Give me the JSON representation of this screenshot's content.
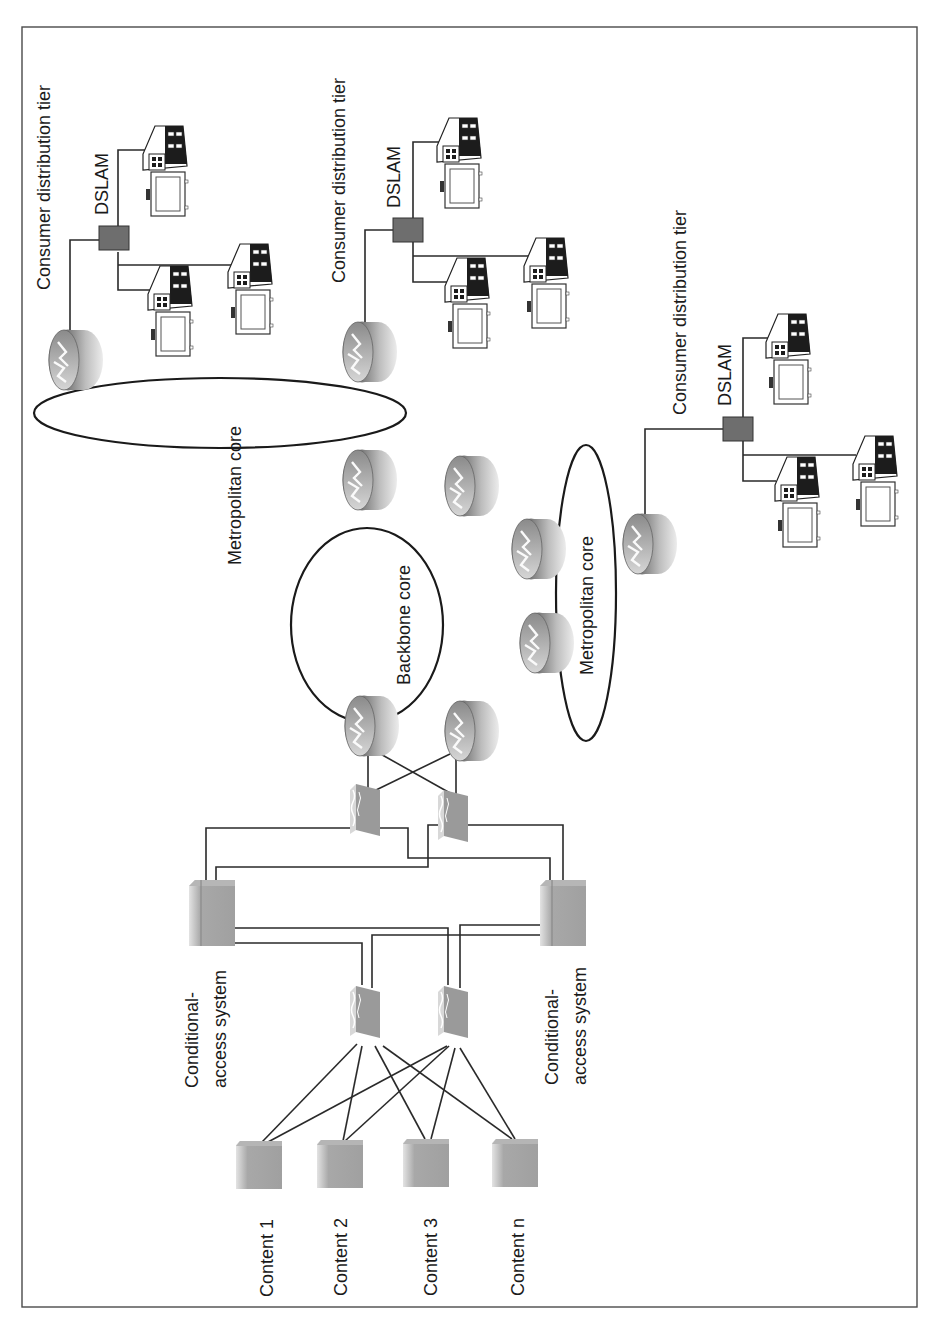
{
  "figure": {
    "frame": {
      "x": 22,
      "y": 27,
      "w": 895,
      "h": 1280
    },
    "label_color": "#1a1a1a"
  },
  "labels": {
    "tier_1": "Consumer distribution tier",
    "tier_2": "Consumer distribution tier",
    "tier_3": "Consumer distribution tier",
    "dslam_1": "DSLAM",
    "dslam_2": "DSLAM",
    "dslam_3": "DSLAM",
    "metro_core_1": "Metropolitan core",
    "metro_core_2": "Metropolitan core",
    "backbone_core": "Backbone core",
    "cas_1_line1": "Conditional-",
    "cas_1_line2": "access system",
    "cas_2_line1": "Conditional-",
    "cas_2_line2": "access system",
    "content_1": "Content 1",
    "content_2": "Content 2",
    "content_3": "Content 3",
    "content_n": "Content n"
  },
  "nodes": {
    "routers": [
      {
        "id": "edge-router-tier1",
        "x": 68,
        "y": 360
      },
      {
        "id": "edge-router-tier2",
        "x": 362,
        "y": 352
      },
      {
        "id": "metro-router-a",
        "x": 362,
        "y": 480
      },
      {
        "id": "metro-router-b",
        "x": 464,
        "y": 486
      },
      {
        "id": "backbone-router-c",
        "x": 531,
        "y": 549
      },
      {
        "id": "backbone-router-d",
        "x": 539,
        "y": 643
      },
      {
        "id": "backbone-router-e",
        "x": 364,
        "y": 726
      },
      {
        "id": "backbone-router-f",
        "x": 464,
        "y": 731
      },
      {
        "id": "edge-router-tier3",
        "x": 642,
        "y": 544
      }
    ],
    "dslams": [
      {
        "id": "dslam-1",
        "x": 112,
        "y": 240
      },
      {
        "id": "dslam-2",
        "x": 406,
        "y": 232
      },
      {
        "id": "dslam-3",
        "x": 736,
        "y": 429
      }
    ],
    "houses": [
      {
        "id": "house-1a",
        "x": 143,
        "y": 125
      },
      {
        "id": "house-1b",
        "x": 147,
        "y": 266
      },
      {
        "id": "house-1c",
        "x": 228,
        "y": 244
      },
      {
        "id": "house-2a",
        "x": 437,
        "y": 118
      },
      {
        "id": "house-2b",
        "x": 444,
        "y": 256
      },
      {
        "id": "house-2c",
        "x": 524,
        "y": 237
      },
      {
        "id": "house-3a",
        "x": 764,
        "y": 313
      },
      {
        "id": "house-3b",
        "x": 774,
        "y": 455
      },
      {
        "id": "house-3c",
        "x": 853,
        "y": 434
      }
    ],
    "firewalls": [
      {
        "id": "firewall-top-a",
        "x": 353,
        "y": 785
      },
      {
        "id": "firewall-top-b",
        "x": 441,
        "y": 789
      },
      {
        "id": "firewall-bottom-a",
        "x": 353,
        "y": 985
      },
      {
        "id": "firewall-bottom-b",
        "x": 441,
        "y": 985
      }
    ],
    "cas_servers": [
      {
        "id": "cas-server-1",
        "x": 189,
        "y": 882
      },
      {
        "id": "cas-server-2",
        "x": 540,
        "y": 882
      }
    ],
    "content_servers": [
      {
        "id": "content-server-1",
        "x": 236,
        "y": 1141
      },
      {
        "id": "content-server-2",
        "x": 317,
        "y": 1140
      },
      {
        "id": "content-server-3",
        "x": 403,
        "y": 1139
      },
      {
        "id": "content-server-n",
        "x": 492,
        "y": 1139
      }
    ]
  },
  "colors": {
    "device_gray": "#9e9e9e",
    "device_light": "#cfcfcf",
    "dslam_fill": "#6e6e6e",
    "house_roof": "#1c1c1c",
    "line": "#2a2a2a"
  }
}
